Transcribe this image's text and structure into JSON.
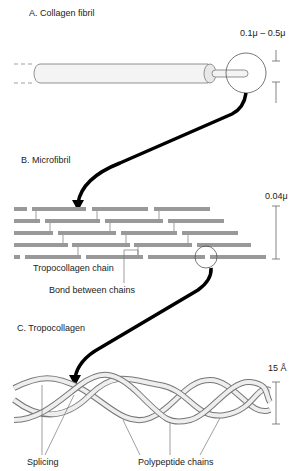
{
  "sections": {
    "a": {
      "title": "A. Collagen fibril",
      "dimension": "0.1μ – 0.5μ"
    },
    "b": {
      "title": "B. Microfibril",
      "dimension": "0.04μ",
      "label_chain": "Tropocollagen chain",
      "label_bond": "Bond between chains"
    },
    "c": {
      "title": "C. Tropocollagen",
      "dimension": "15 Å",
      "label_splicing": "Splicing",
      "label_polypeptide": "Polypeptide chains"
    }
  },
  "colors": {
    "bar": "#999999",
    "fibril_fill": "#f2f2f2",
    "line": "#555555",
    "arrow": "#000000"
  }
}
